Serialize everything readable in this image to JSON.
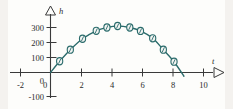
{
  "chart_data": {
    "type": "line",
    "title": "",
    "subtitle": "",
    "xlabel": "t",
    "ylabel": "h",
    "xlim": [
      -3,
      11.4
    ],
    "ylim": [
      -130,
      355
    ],
    "grid": false,
    "legend": null,
    "annotations": [],
    "x_ticks": [
      -2,
      0,
      2,
      4,
      6,
      8,
      10
    ],
    "x_tick_labels": [
      "-2",
      "0",
      "2",
      "4",
      "6",
      "8",
      "10"
    ],
    "y_ticks": [
      -100,
      0,
      100,
      200,
      300
    ],
    "y_tick_labels": [
      "-100",
      "0",
      "100",
      "200",
      "300"
    ],
    "series": [
      {
        "name": "h",
        "marker": "circle",
        "color": "#2a6b6b",
        "x": [
          0.6,
          1.3,
          2.1,
          3.0,
          3.7,
          4.4,
          5.2,
          5.9,
          6.7,
          7.4,
          8.1
        ],
        "y": [
          75,
          152,
          225,
          278,
          300,
          310,
          300,
          277,
          228,
          152,
          72
        ]
      }
    ],
    "curve_x": [
      0.0,
      0.6,
      1.3,
      2.1,
      3.0,
      3.7,
      4.4,
      5.2,
      5.9,
      6.7,
      7.4,
      8.1,
      8.75
    ],
    "curve_y": [
      0,
      75,
      152,
      225,
      278,
      300,
      310,
      300,
      277,
      228,
      152,
      72,
      -25
    ]
  },
  "axes": {
    "x_axis_label": "t",
    "y_axis_label": "h",
    "x_arrow_icon": "triangle-right-icon",
    "y_arrow_icon": "triangle-up-icon"
  }
}
